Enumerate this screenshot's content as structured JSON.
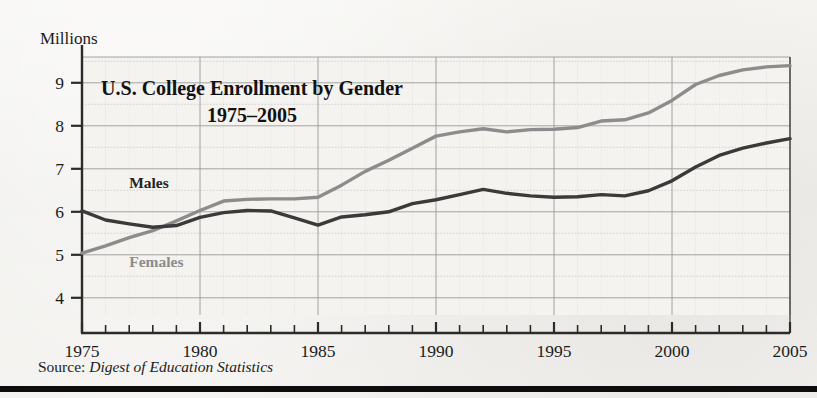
{
  "figure": {
    "y_axis_unit_label": "Millions",
    "source_prefix": "Source:",
    "source_publication": "Digest of Education Statistics"
  },
  "colors": {
    "males_line": "#3a3a3a",
    "females_line": "#8c8c8c",
    "axis": "#2b2b2b",
    "grid_major": "#9a9a9a",
    "grid_minor": "#c3c3c3",
    "text": "#1b1b1b",
    "background": "#f2f1ee",
    "rule": "#0d0d0d"
  },
  "chart_data": {
    "type": "line",
    "title": "U.S. College Enrollment by Gender",
    "subtitle": "1975–2005",
    "xlabel": "",
    "ylabel": "Millions",
    "xlim": [
      1975,
      2005
    ],
    "ylim": [
      3.6,
      9.6
    ],
    "y_ticks": [
      4,
      5,
      6,
      7,
      8,
      9
    ],
    "y_tick_labels": [
      "4",
      "5",
      "6",
      "7",
      "8",
      "9"
    ],
    "y_minor_step": 0.5,
    "x_ticks": [
      1975,
      1980,
      1985,
      1990,
      1995,
      2000,
      2005
    ],
    "x_tick_labels": [
      "1975",
      "1980",
      "1985",
      "1990",
      "1995",
      "2000",
      "2005"
    ],
    "x_minor_step": 1,
    "grid": true,
    "legend_position": "inline-annotation",
    "x": [
      1975,
      1976,
      1977,
      1978,
      1979,
      1980,
      1981,
      1982,
      1983,
      1984,
      1985,
      1986,
      1987,
      1988,
      1989,
      1990,
      1991,
      1992,
      1993,
      1994,
      1995,
      1996,
      1997,
      1998,
      1999,
      2000,
      2001,
      2002,
      2003,
      2004,
      2005
    ],
    "series": [
      {
        "name": "Males",
        "color": "#3a3a3a",
        "label_x": 1977.0,
        "label_y": 6.55,
        "values": [
          6.02,
          5.81,
          5.72,
          5.64,
          5.68,
          5.87,
          5.98,
          6.03,
          6.02,
          5.86,
          5.69,
          5.88,
          5.93,
          6.0,
          6.19,
          6.28,
          6.4,
          6.52,
          6.43,
          6.37,
          6.34,
          6.35,
          6.4,
          6.37,
          6.49,
          6.72,
          7.04,
          7.31,
          7.48,
          7.6,
          7.7
        ]
      },
      {
        "name": "Females",
        "color": "#8c8c8c",
        "label_x": 1977.0,
        "label_y": 4.72,
        "values": [
          5.04,
          5.21,
          5.4,
          5.56,
          5.79,
          6.03,
          6.25,
          6.29,
          6.3,
          6.3,
          6.34,
          6.62,
          6.94,
          7.2,
          7.48,
          7.76,
          7.86,
          7.93,
          7.86,
          7.91,
          7.92,
          7.96,
          8.11,
          8.14,
          8.3,
          8.59,
          8.96,
          9.17,
          9.3,
          9.37,
          9.4
        ]
      }
    ],
    "annotations": [
      {
        "text": "U.S. College Enrollment by Gender",
        "role": "title"
      },
      {
        "text": "1975–2005",
        "role": "subtitle"
      },
      {
        "text": "Males",
        "role": "series-label"
      },
      {
        "text": "Females",
        "role": "series-label"
      }
    ]
  }
}
